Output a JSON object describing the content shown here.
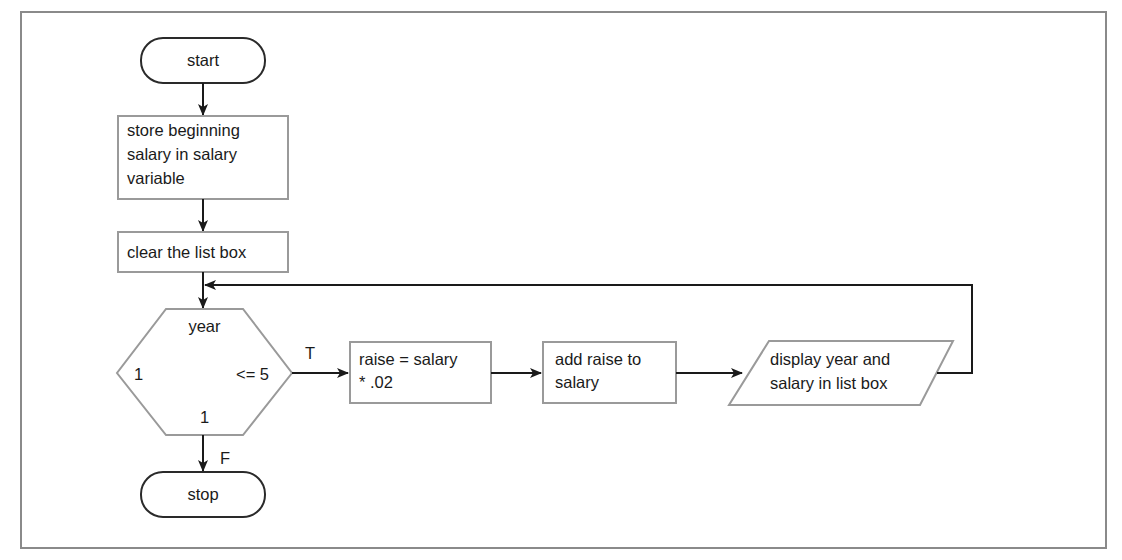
{
  "flowchart": {
    "start": "start",
    "store": [
      "store beginning",
      "salary in salary",
      "variable"
    ],
    "clear": "clear the list box",
    "loop": {
      "variable": "year",
      "start_value": "1",
      "condition": "<= 5",
      "step": "1"
    },
    "true_label": "T",
    "false_label": "F",
    "raise": [
      "raise = salary",
      "* .02"
    ],
    "add": [
      "add raise to",
      "salary"
    ],
    "display": [
      "display year and",
      "salary in list box"
    ],
    "stop": "stop"
  },
  "colors": {
    "frame": "#8a8a8a",
    "shape_border": "#9a9a9a",
    "terminal_border": "#2a2a2a",
    "line": "#1a1a1a"
  }
}
